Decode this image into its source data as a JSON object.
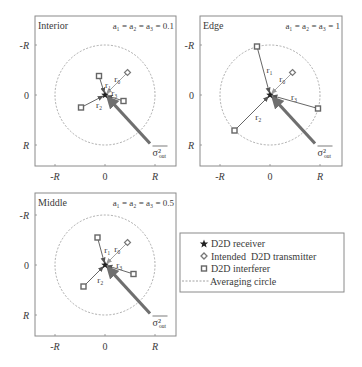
{
  "panels": [
    {
      "id": "interior",
      "title": "Interior",
      "param": "a₁ = a₂ = a₃ = 0.1",
      "a": 0.1,
      "tick_labels": {
        "neg": "-R",
        "zero": "0",
        "pos": "R"
      },
      "receiver": [
        0,
        0
      ],
      "transmitter": {
        "pos": [
          0.45,
          -0.45
        ],
        "label": "r₀"
      },
      "interferers": [
        {
          "pos": [
            -0.12,
            -0.38
          ],
          "label": "r₁"
        },
        {
          "pos": [
            -0.48,
            0.25
          ],
          "label": "r₂"
        },
        {
          "pos": [
            0.37,
            0.12
          ],
          "label": "r₃"
        }
      ],
      "sigma_label": "σ²",
      "sigma_sub": "out"
    },
    {
      "id": "edge",
      "title": "Edge",
      "param": "a₁ = a₂ = a₃ = 1",
      "a": 1,
      "tick_labels": {
        "neg": "-R",
        "zero": "0",
        "pos": "R"
      },
      "receiver": [
        0,
        0
      ],
      "transmitter": {
        "pos": [
          0.45,
          -0.45
        ],
        "label": "r₀"
      },
      "interferers": [
        {
          "pos": [
            -0.26,
            -0.97
          ],
          "label": "r₁"
        },
        {
          "pos": [
            -0.71,
            0.71
          ],
          "label": "r₂"
        },
        {
          "pos": [
            0.96,
            0.27
          ],
          "label": "r₃"
        }
      ],
      "sigma_label": "σ²",
      "sigma_sub": "out"
    },
    {
      "id": "middle",
      "title": "Middle",
      "param": "a₁ = a₂ = a₃ = 0.5",
      "a": 0.5,
      "tick_labels": {
        "neg": "-R",
        "zero": "0",
        "pos": "R"
      },
      "receiver": [
        0,
        0
      ],
      "transmitter": {
        "pos": [
          0.45,
          -0.45
        ],
        "label": "r₀"
      },
      "interferers": [
        {
          "pos": [
            -0.15,
            -0.55
          ],
          "label": "r₁"
        },
        {
          "pos": [
            -0.43,
            0.43
          ],
          "label": "r₂"
        },
        {
          "pos": [
            0.57,
            0.18
          ],
          "label": "r₃"
        }
      ],
      "sigma_label": "σ²",
      "sigma_sub": "out"
    }
  ],
  "legend": {
    "items": [
      {
        "icon": "star-icon",
        "label": "D2D receiver"
      },
      {
        "icon": "diamond-icon",
        "label": "Intended  D2D transmitter"
      },
      {
        "icon": "square-icon",
        "label": "D2D interferer"
      },
      {
        "icon": "dashed-line-icon",
        "label": "Averaging circle"
      }
    ]
  },
  "colors": {
    "frame": "#8a8a8a",
    "circle": "#8a8a8a",
    "arrow": "#6f6f6f",
    "line": "#555555",
    "tx_line": "#9a9a9a",
    "text": "#3a3a3a"
  }
}
